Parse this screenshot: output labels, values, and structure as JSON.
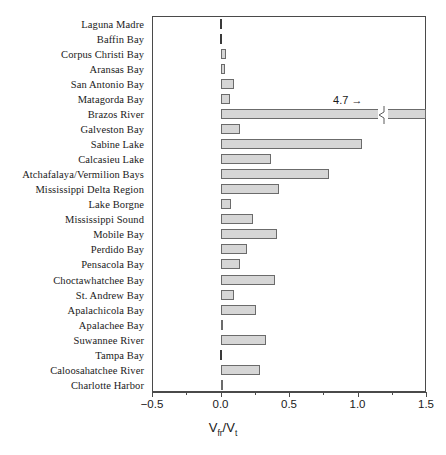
{
  "chart_data": {
    "type": "bar",
    "orientation": "horizontal",
    "title": "",
    "xlabel": "Vfr/Vt",
    "xlabel_parts": {
      "v1": "V",
      "sub1": "fr",
      "slash": "/",
      "v2": "V",
      "sub2": "t"
    },
    "ylabel": "",
    "xlim": [
      -0.5,
      1.5
    ],
    "xticks": [
      -0.5,
      0.0,
      0.5,
      1.0,
      1.5
    ],
    "xticklabels": [
      "−0.5",
      "0.0",
      "0.5",
      "1.0",
      "1.5"
    ],
    "grid": false,
    "legend": null,
    "bar_color": "#d6d6d6",
    "bar_edge_color": "#6b6b6b",
    "categories": [
      "Laguna Madre",
      "Baffin Bay",
      "Corpus Christi Bay",
      "Aransas Bay",
      "San Antonio Bay",
      "Matagorda Bay",
      "Brazos River",
      "Galveston Bay",
      "Sabine Lake",
      "Calcasieu Lake",
      "Atchafalaya/Vermilion Bays",
      "Mississippi Delta Region",
      "Lake Borgne",
      "Mississippi Sound",
      "Mobile Bay",
      "Perdido Bay",
      "Pensacola Bay",
      "Choctawhatchee Bay",
      "St. Andrew Bay",
      "Apalachicola Bay",
      "Apalachee Bay",
      "Suwannee River",
      "Tampa Bay",
      "Caloosahatchee River",
      "Charlotte Harbor"
    ],
    "values": [
      0.005,
      0.005,
      0.04,
      0.03,
      0.1,
      0.07,
      4.7,
      0.14,
      1.03,
      0.37,
      0.79,
      0.43,
      0.08,
      0.24,
      0.41,
      0.19,
      0.14,
      0.4,
      0.1,
      0.26,
      0.02,
      0.33,
      0.005,
      0.29,
      0.02
    ],
    "annotations": [
      {
        "text": "4.7",
        "arrow": "→",
        "for_category": "Brazos River",
        "note": "Brazos River bar is truncated with an axis break; true value 4.7"
      }
    ],
    "broken_bar": {
      "category": "Brazos River",
      "break_at_value": 1.15,
      "resumes_at_value": 1.22,
      "extends_to_axis_end": true
    }
  }
}
